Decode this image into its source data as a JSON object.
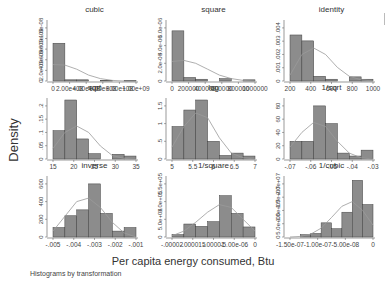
{
  "chart_data": {
    "type": "histogram-grid",
    "title": "",
    "xlabel": "Per capita energy consumed, Btu",
    "ylabel": "Density",
    "note": "Histograms by transformation",
    "bar_color": "#8c8c8c",
    "bar_edge": "#404040",
    "curve_color": "#9a9a9a",
    "panels": [
      {
        "title": "cubic",
        "xticks": [
          "0",
          "2.00e+08",
          "4.00e+08",
          "6.00e+08",
          "8.00e+08",
          "1.00e+09"
        ],
        "yticks": [
          "0",
          "2.0e-09",
          "4.0e-09",
          "6.0e-09",
          "8.0e-09",
          "1.0e-08"
        ],
        "bins": [
          0.64,
          0.02,
          0.02,
          0.0,
          0.01,
          0.0,
          0.01
        ],
        "curve": [
          0.28,
          0.27,
          0.2,
          0.1,
          0.04,
          0.01,
          0.0,
          0.0
        ]
      },
      {
        "title": "square",
        "xticks": [
          "0",
          "200000",
          "400000",
          "600000",
          "800000",
          "1000000"
        ],
        "yticks": [
          "0",
          "2.0e-06",
          "4.0e-06",
          "6.0e-06"
        ],
        "bins": [
          0.85,
          0.06,
          0.03,
          0.0,
          0.04,
          0.0,
          0.02
        ],
        "curve": [
          0.33,
          0.35,
          0.3,
          0.2,
          0.1,
          0.04,
          0.01,
          0.0
        ]
      },
      {
        "title": "identity",
        "xticks": [
          "200",
          "400",
          "600",
          "800",
          "1000"
        ],
        "yticks": [
          "0",
          ".001",
          ".002",
          ".003",
          ".004"
        ],
        "bins": [
          0.78,
          0.68,
          0.08,
          0.03,
          0.0,
          0.07,
          0.03
        ],
        "curve": [
          0.1,
          0.45,
          0.56,
          0.45,
          0.23,
          0.08,
          0.02,
          0.0
        ]
      },
      {
        "title": "sqrt",
        "xticks": [
          "15",
          "20",
          "25",
          "30",
          "35"
        ],
        "yticks": [
          "0",
          ".05",
          ".1",
          ".15",
          ".2"
        ],
        "bins": [
          0.48,
          1.0,
          0.34,
          0.09,
          0.0,
          0.08,
          0.05
        ],
        "curve": [
          0.18,
          0.45,
          0.56,
          0.45,
          0.22,
          0.06,
          0.01,
          0.0
        ]
      },
      {
        "title": "log",
        "xticks": [
          "5",
          "5.5",
          "6",
          "6.5",
          "7"
        ],
        "yticks": [
          "0",
          ".5",
          "1",
          "1.5"
        ],
        "bins": [
          0.55,
          0.83,
          1.0,
          0.3,
          0.06,
          0.1,
          0.05
        ],
        "curve": [
          0.2,
          0.55,
          0.78,
          0.7,
          0.36,
          0.1,
          0.02,
          0.0
        ]
      },
      {
        "title": "1/sqrt",
        "xticks": [
          "-.07",
          "-.06",
          "-.05",
          "-.04",
          "-.03"
        ],
        "yticks": [
          "0",
          "20",
          "40",
          "60",
          "80"
        ],
        "bins": [
          0.3,
          0.3,
          0.9,
          0.6,
          0.1,
          0.05,
          0.15
        ],
        "curve": [
          0.2,
          0.45,
          0.62,
          0.55,
          0.3,
          0.1,
          0.02,
          0.0
        ]
      },
      {
        "title": "inverse",
        "xticks": [
          "-.005",
          "-.004",
          "-.003",
          "-.002",
          "-.001"
        ],
        "yticks": [
          "0",
          "200",
          "400",
          "600"
        ],
        "bins": [
          0.16,
          0.36,
          0.46,
          0.9,
          0.4,
          0.1,
          0.16
        ],
        "curve": [
          0.1,
          0.35,
          0.6,
          0.66,
          0.5,
          0.25,
          0.07,
          0.0
        ]
      },
      {
        "title": "1/square",
        "xticks": [
          "-.00002",
          "-.000015",
          "-.00001",
          "-5.00e-06",
          "0"
        ],
        "yticks": [
          "0",
          "5.0e+04",
          "1.0e+05",
          "1.5e+05"
        ],
        "bins": [
          0.04,
          0.22,
          0.18,
          0.26,
          0.7,
          0.4,
          0.17
        ],
        "curve": [
          0.02,
          0.1,
          0.25,
          0.42,
          0.55,
          0.5,
          0.3,
          0.1
        ]
      },
      {
        "title": "1/cubic",
        "xticks": [
          "-1.50e-07",
          "-1.00e-07",
          "-5.00e-08",
          "0"
        ],
        "yticks": [
          "0",
          "5.0e+06",
          "1.0e+07",
          "1.5e+07",
          "2.0e+07"
        ],
        "bins": [
          0.0,
          0.04,
          0.06,
          0.24,
          0.14,
          0.42,
          0.96,
          0.55
        ],
        "curve": [
          0.0,
          0.01,
          0.05,
          0.15,
          0.33,
          0.52,
          0.6,
          0.45,
          0.2
        ]
      }
    ]
  }
}
